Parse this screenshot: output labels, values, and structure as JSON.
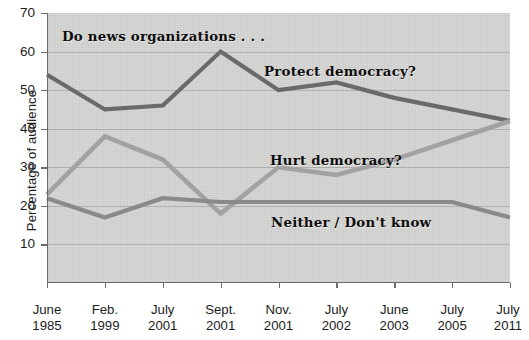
{
  "chart_data": {
    "type": "line",
    "title": "Do news organizations . . .",
    "xlabel": "",
    "ylabel": "Percentage of audience",
    "ylim": [
      0,
      70
    ],
    "ytick_values": [
      10,
      20,
      30,
      40,
      50,
      60,
      70
    ],
    "ytick_labels": [
      "10",
      "20",
      "30",
      "40",
      "50",
      "60",
      "70"
    ],
    "grid": true,
    "legend_position": "inline-annotations",
    "categories": [
      {
        "line1": "June",
        "line2": "1985"
      },
      {
        "line1": "Feb.",
        "line2": "1999"
      },
      {
        "line1": "July",
        "line2": "2001"
      },
      {
        "line1": "Sept.",
        "line2": "2001"
      },
      {
        "line1": "Nov.",
        "line2": "2001"
      },
      {
        "line1": "July",
        "line2": "2002"
      },
      {
        "line1": "June",
        "line2": "2003"
      },
      {
        "line1": "July",
        "line2": "2005"
      },
      {
        "line1": "July",
        "line2": "2011"
      }
    ],
    "series": [
      {
        "name": "Protect democracy?",
        "color": "#6a6a6a",
        "values": [
          54,
          45,
          46,
          60,
          50,
          52,
          48,
          45,
          42
        ]
      },
      {
        "name": "Hurt democracy?",
        "color": "#a2a2a2",
        "values": [
          23,
          38,
          32,
          18,
          30,
          28,
          32,
          37,
          42
        ]
      },
      {
        "name": "Neither / Don't know",
        "color": "#8a8a8a",
        "values": [
          22,
          17,
          22,
          21,
          21,
          21,
          21,
          21,
          17
        ]
      }
    ],
    "annotations": [
      {
        "text": "Do news organizations . . .",
        "x_index": 0.25,
        "y_value": 65.5
      },
      {
        "text": "Protect democracy?",
        "x_index": 3.85,
        "y_value": 56.5
      },
      {
        "text": "Hurt democracy?",
        "x_index": 4.0,
        "y_value": 34.0
      },
      {
        "text": "Neither / Don't know",
        "x_index": 5.2,
        "y_value": 16.0
      }
    ],
    "colors": {
      "panel_background": "#d6d6d4",
      "page_background": "#ffffff",
      "axis": "#6c6c6c",
      "gridline": "#8c8c8c",
      "text": "#1c1c1c"
    }
  }
}
